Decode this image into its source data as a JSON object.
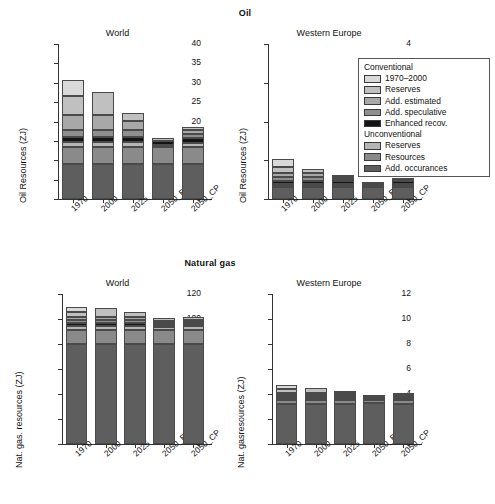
{
  "figure": {
    "sections": [
      {
        "name": "Oil",
        "label": "Oil"
      },
      {
        "name": "Natural gas",
        "label": "Natural gas"
      }
    ]
  },
  "legend": {
    "groups": [
      {
        "heading": "Conventional",
        "items": [
          {
            "label": "1970–2000",
            "color": "#d9d9d9"
          },
          {
            "label": "Reserves",
            "color": "#c0c0c0"
          },
          {
            "label": "Add. estimated",
            "color": "#a8a8a8"
          },
          {
            "label": "Add. speculative",
            "color": "#8f8f8f"
          },
          {
            "label": "Enhanced recov.",
            "color": "#141414"
          }
        ]
      },
      {
        "heading": "Unconventional",
        "items": [
          {
            "label": "Reserves",
            "color": "#b5b5b5"
          },
          {
            "label": "Resources",
            "color": "#8a8a8a"
          },
          {
            "label": "Add. occurances",
            "color": "#5e5e5e"
          }
        ]
      }
    ]
  },
  "chart_data": [
    {
      "id": "oil-world",
      "type": "bar",
      "stacked": true,
      "title": "World",
      "section": "Oil",
      "xlabel": "",
      "ylabel": "Oil Resources (ZJ)",
      "ylim": [
        0,
        40
      ],
      "yticks": [
        0,
        5,
        10,
        15,
        20,
        25,
        30,
        35,
        40
      ],
      "grid": false,
      "legend_position": "none",
      "categories": [
        "1970",
        "2000",
        "2025",
        "2050_B",
        "2050_CP"
      ],
      "series": [
        {
          "name": "Add. occurances",
          "group": "Unconventional",
          "color": "#5e5e5e",
          "values": [
            9.0,
            9.0,
            9.0,
            9.0,
            9.0
          ]
        },
        {
          "name": "Resources",
          "group": "Unconventional",
          "color": "#8a8a8a",
          "values": [
            4.3,
            4.3,
            4.3,
            4.5,
            4.4
          ]
        },
        {
          "name": "Reserves",
          "group": "Unconventional",
          "color": "#b5b5b5",
          "values": [
            1.4,
            1.4,
            1.4,
            0.4,
            1.0
          ]
        },
        {
          "name": "Enhanced recov.",
          "group": "Conventional",
          "color": "#141414",
          "values": [
            1.4,
            1.4,
            1.4,
            1.0,
            1.4
          ]
        },
        {
          "name": "Add. speculative",
          "group": "Conventional",
          "color": "#8f8f8f",
          "values": [
            1.8,
            1.8,
            1.8,
            0.0,
            1.1
          ]
        },
        {
          "name": "Add. estimated",
          "group": "Conventional",
          "color": "#a8a8a8",
          "values": [
            3.8,
            3.8,
            2.3,
            0.0,
            0.8
          ]
        },
        {
          "name": "Reserves",
          "group": "Conventional",
          "color": "#c0c0c0",
          "values": [
            4.8,
            5.8,
            2.0,
            0.8,
            0.8
          ]
        },
        {
          "name": "1970–2000",
          "group": "Conventional",
          "color": "#d9d9d9",
          "values": [
            4.3,
            0.0,
            0.0,
            0.0,
            0.0
          ]
        }
      ],
      "totals": [
        30.8,
        26.5,
        22.2,
        15.7,
        18.5
      ]
    },
    {
      "id": "oil-western-europe",
      "type": "bar",
      "stacked": true,
      "title": "Western Europe",
      "section": "Oil",
      "xlabel": "",
      "ylabel": "Oil Resources (ZJ)",
      "ylim": [
        0,
        4
      ],
      "yticks": [
        0,
        1,
        2,
        3,
        4
      ],
      "grid": false,
      "legend_position": "upper right",
      "categories": [
        "1970",
        "2000",
        "2025",
        "2050_B",
        "2050_CP"
      ],
      "series": [
        {
          "name": "Add. occurances",
          "group": "Unconventional",
          "color": "#5e5e5e",
          "values": [
            0.3,
            0.3,
            0.3,
            0.3,
            0.3
          ]
        },
        {
          "name": "Resources",
          "group": "Unconventional",
          "color": "#8a8a8a",
          "values": [
            0.06,
            0.06,
            0.06,
            0.05,
            0.06
          ]
        },
        {
          "name": "Reserves",
          "group": "Unconventional",
          "color": "#b5b5b5",
          "values": [
            0.04,
            0.04,
            0.04,
            0.02,
            0.04
          ]
        },
        {
          "name": "Enhanced recov.",
          "group": "Conventional",
          "color": "#141414",
          "values": [
            0.07,
            0.07,
            0.07,
            0.02,
            0.06
          ]
        },
        {
          "name": "Add. speculative",
          "group": "Conventional",
          "color": "#8f8f8f",
          "values": [
            0.09,
            0.09,
            0.04,
            0.0,
            0.02
          ]
        },
        {
          "name": "Add. estimated",
          "group": "Conventional",
          "color": "#a8a8a8",
          "values": [
            0.11,
            0.11,
            0.06,
            0.0,
            0.02
          ]
        },
        {
          "name": "Reserves",
          "group": "Conventional",
          "color": "#c0c0c0",
          "values": [
            0.16,
            0.1,
            0.03,
            0.01,
            0.02
          ]
        },
        {
          "name": "1970–2000",
          "group": "Conventional",
          "color": "#d9d9d9",
          "values": [
            0.19,
            0.0,
            0.0,
            0.0,
            0.0
          ]
        }
      ],
      "totals": [
        1.02,
        0.77,
        0.6,
        0.4,
        0.52
      ]
    },
    {
      "id": "gas-world",
      "type": "bar",
      "stacked": true,
      "title": "World",
      "section": "Natural gas",
      "xlabel": "",
      "ylabel": "Nat. gas. resources (ZJ)",
      "ylim": [
        0,
        120
      ],
      "yticks": [
        0,
        20,
        40,
        60,
        80,
        100,
        120
      ],
      "grid": false,
      "legend_position": "none",
      "categories": [
        "1970",
        "2000",
        "2025",
        "2050_B",
        "2050_CP"
      ],
      "series": [
        {
          "name": "Add. occurances",
          "group": "Unconventional",
          "color": "#5e5e5e",
          "values": [
            80.0,
            80.0,
            80.0,
            80.0,
            80.0
          ]
        },
        {
          "name": "Resources",
          "group": "Unconventional",
          "color": "#8a8a8a",
          "values": [
            11.0,
            11.0,
            11.0,
            11.5,
            11.0
          ]
        },
        {
          "name": "Reserves",
          "group": "Unconventional",
          "color": "#b5b5b5",
          "values": [
            3.5,
            3.5,
            3.5,
            2.5,
            3.2
          ]
        },
        {
          "name": "Enhanced recov.",
          "group": "Conventional",
          "color": "#141414",
          "values": [
            2.0,
            2.0,
            2.0,
            1.5,
            2.0
          ]
        },
        {
          "name": "Add. speculative",
          "group": "Conventional",
          "color": "#8f8f8f",
          "values": [
            2.5,
            2.5,
            2.5,
            1.5,
            1.8
          ]
        },
        {
          "name": "Add. estimated",
          "group": "Conventional",
          "color": "#a8a8a8",
          "values": [
            3.0,
            3.0,
            2.5,
            1.5,
            1.5
          ]
        },
        {
          "name": "Reserves",
          "group": "Conventional",
          "color": "#c0c0c0",
          "values": [
            4.0,
            6.5,
            4.0,
            2.0,
            2.0
          ]
        },
        {
          "name": "1970–2000",
          "group": "Conventional",
          "color": "#d9d9d9",
          "values": [
            4.0,
            0.0,
            0.0,
            0.0,
            0.0
          ]
        }
      ],
      "totals": [
        110.0,
        108.5,
        105.5,
        100.5,
        101.5
      ]
    },
    {
      "id": "gas-western-europe",
      "type": "bar",
      "stacked": true,
      "title": "Western Europe",
      "section": "Natural gas",
      "xlabel": "",
      "ylabel": "Nat. gasresources (ZJ)",
      "ylim": [
        0,
        12
      ],
      "yticks": [
        0,
        2,
        4,
        6,
        8,
        10,
        12
      ],
      "grid": false,
      "legend_position": "none",
      "categories": [
        "1970",
        "2000",
        "2025",
        "2050_B",
        "2050_CP"
      ],
      "series": [
        {
          "name": "Add. occurances",
          "group": "Unconventional",
          "color": "#5e5e5e",
          "values": [
            3.2,
            3.2,
            3.2,
            3.25,
            3.2
          ]
        },
        {
          "name": "Resources",
          "group": "Unconventional",
          "color": "#8a8a8a",
          "values": [
            0.35,
            0.35,
            0.35,
            0.3,
            0.35
          ]
        },
        {
          "name": "Reserves",
          "group": "Unconventional",
          "color": "#b5b5b5",
          "values": [
            0.12,
            0.12,
            0.12,
            0.08,
            0.12
          ]
        },
        {
          "name": "Enhanced recov.",
          "group": "Conventional",
          "color": "#141414",
          "values": [
            0.12,
            0.12,
            0.12,
            0.07,
            0.1
          ]
        },
        {
          "name": "Add. speculative",
          "group": "Conventional",
          "color": "#8f8f8f",
          "values": [
            0.15,
            0.15,
            0.12,
            0.05,
            0.06
          ]
        },
        {
          "name": "Add. estimated",
          "group": "Conventional",
          "color": "#a8a8a8",
          "values": [
            0.18,
            0.18,
            0.14,
            0.05,
            0.07
          ]
        },
        {
          "name": "Reserves",
          "group": "Conventional",
          "color": "#c0c0c0",
          "values": [
            0.28,
            0.38,
            0.15,
            0.05,
            0.05
          ]
        },
        {
          "name": "1970–2000",
          "group": "Conventional",
          "color": "#d9d9d9",
          "values": [
            0.3,
            0.0,
            0.0,
            0.0,
            0.0
          ]
        }
      ],
      "totals": [
        4.7,
        4.5,
        4.2,
        3.85,
        3.95
      ]
    }
  ]
}
